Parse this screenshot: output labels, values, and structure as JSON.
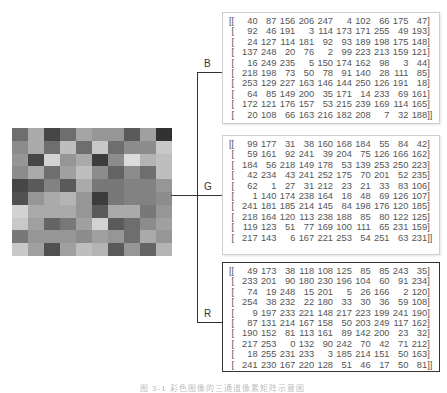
{
  "figure": {
    "caption": "图 3-1  彩色图像的三通道像素矩阵示意图",
    "image": {
      "rows": 10,
      "cols": 10,
      "gray_levels": [
        [
          110,
          170,
          70,
          110,
          165,
          150,
          150,
          90,
          160,
          50
        ],
        [
          140,
          170,
          110,
          190,
          110,
          200,
          110,
          140,
          140,
          200
        ],
        [
          150,
          70,
          210,
          150,
          170,
          60,
          140,
          220,
          180,
          190
        ],
        [
          140,
          170,
          110,
          160,
          190,
          140,
          100,
          140,
          110,
          190
        ],
        [
          70,
          90,
          130,
          90,
          170,
          120,
          120,
          130,
          130,
          150
        ],
        [
          80,
          150,
          170,
          180,
          150,
          60,
          120,
          130,
          130,
          140
        ],
        [
          210,
          170,
          170,
          170,
          150,
          90,
          170,
          170,
          120,
          150
        ],
        [
          200,
          160,
          100,
          120,
          160,
          210,
          90,
          110,
          140,
          160
        ],
        [
          120,
          150,
          150,
          150,
          140,
          160,
          150,
          110,
          170,
          150
        ],
        [
          200,
          160,
          80,
          160,
          190,
          180,
          90,
          150,
          100,
          180
        ]
      ]
    },
    "channels": [
      {
        "label": "B",
        "border": "light",
        "matrix": [
          [
            40,
            87,
            156,
            206,
            247,
            4,
            102,
            66,
            175,
            47
          ],
          [
            92,
            46,
            191,
            3,
            114,
            173,
            171,
            255,
            49,
            193
          ],
          [
            24,
            127,
            114,
            181,
            92,
            93,
            189,
            198,
            175,
            148
          ],
          [
            137,
            248,
            20,
            76,
            2,
            99,
            223,
            213,
            159,
            121
          ],
          [
            16,
            249,
            235,
            5,
            150,
            174,
            162,
            98,
            3,
            44
          ],
          [
            218,
            198,
            73,
            50,
            78,
            91,
            140,
            28,
            111,
            85
          ],
          [
            253,
            129,
            227,
            163,
            146,
            144,
            250,
            126,
            191,
            18
          ],
          [
            64,
            85,
            149,
            200,
            35,
            171,
            14,
            233,
            69,
            161
          ],
          [
            172,
            121,
            176,
            157,
            53,
            215,
            239,
            169,
            114,
            165
          ],
          [
            20,
            108,
            66,
            163,
            216,
            182,
            208,
            7,
            32,
            188
          ]
        ]
      },
      {
        "label": "G",
        "border": "light",
        "matrix": [
          [
            99,
            177,
            31,
            38,
            160,
            168,
            184,
            55,
            84,
            42
          ],
          [
            59,
            161,
            92,
            241,
            39,
            204,
            75,
            126,
            166,
            162
          ],
          [
            184,
            56,
            218,
            149,
            178,
            53,
            139,
            253,
            250,
            223
          ],
          [
            42,
            234,
            43,
            241,
            252,
            175,
            70,
            201,
            52,
            235
          ],
          [
            62,
            1,
            27,
            31,
            212,
            23,
            21,
            33,
            83,
            106
          ],
          [
            1,
            140,
            174,
            238,
            164,
            18,
            48,
            69,
            126,
            107
          ],
          [
            241,
            181,
            185,
            214,
            145,
            84,
            198,
            176,
            120,
            185
          ],
          [
            218,
            164,
            120,
            113,
            238,
            188,
            85,
            80,
            122,
            125
          ],
          [
            119,
            123,
            51,
            77,
            169,
            100,
            111,
            65,
            231,
            159
          ],
          [
            217,
            143,
            6,
            167,
            221,
            253,
            54,
            251,
            63,
            231
          ]
        ]
      },
      {
        "label": "R",
        "border": "dark",
        "matrix": [
          [
            49,
            173,
            38,
            118,
            108,
            125,
            85,
            85,
            243,
            35
          ],
          [
            233,
            201,
            90,
            180,
            230,
            196,
            104,
            60,
            91,
            234
          ],
          [
            74,
            19,
            248,
            15,
            201,
            5,
            26,
            166,
            2,
            120
          ],
          [
            254,
            38,
            232,
            22,
            180,
            33,
            30,
            36,
            59,
            108
          ],
          [
            9,
            197,
            233,
            221,
            148,
            217,
            223,
            199,
            241,
            190
          ],
          [
            87,
            131,
            214,
            167,
            158,
            50,
            203,
            249,
            117,
            162
          ],
          [
            190,
            152,
            81,
            113,
            161,
            89,
            142,
            200,
            23,
            32
          ],
          [
            217,
            253,
            0,
            132,
            90,
            242,
            70,
            42,
            71,
            212
          ],
          [
            18,
            255,
            231,
            233,
            3,
            185,
            214,
            151,
            50,
            163
          ],
          [
            241,
            230,
            167,
            220,
            128,
            51,
            46,
            17,
            50,
            81
          ]
        ]
      }
    ]
  }
}
